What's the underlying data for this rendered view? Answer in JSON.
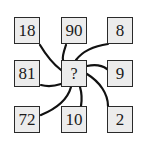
{
  "diagram": {
    "center": {
      "label": "?"
    },
    "cells": [
      {
        "id": "top-left",
        "label": "18",
        "x": 14,
        "y": 17
      },
      {
        "id": "top-middle",
        "label": "90",
        "x": 61,
        "y": 17
      },
      {
        "id": "top-right",
        "label": "8",
        "x": 107,
        "y": 17
      },
      {
        "id": "middle-left",
        "label": "81",
        "x": 14,
        "y": 60
      },
      {
        "id": "middle-right",
        "label": "9",
        "x": 107,
        "y": 60
      },
      {
        "id": "bottom-left",
        "label": "72",
        "x": 14,
        "y": 106
      },
      {
        "id": "bottom-middle",
        "label": "10",
        "x": 61,
        "y": 106
      },
      {
        "id": "bottom-right",
        "label": "2",
        "x": 107,
        "y": 106
      }
    ],
    "colors": {
      "box_fill": "#ececec",
      "border": "#2a2a2a",
      "line": "#111111",
      "background": "#ffffff"
    }
  }
}
